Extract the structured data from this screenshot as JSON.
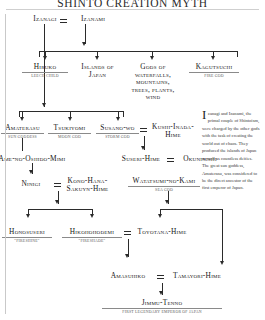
{
  "title": "SHINTO CREATION MYTH",
  "marriage_symbol": "=",
  "nodes": {
    "izanagi": {
      "name": "Izanagi",
      "sub": ""
    },
    "izanami": {
      "name": "Izanami",
      "sub": ""
    },
    "hiruko": {
      "name": "Hiruko",
      "sub": "LEECH CHILD"
    },
    "islands": {
      "name": "Islands of Japan",
      "sub": ""
    },
    "gods_nature": {
      "name": "Gods of waterfalls, mountains, trees, plants, wind",
      "sub": ""
    },
    "kagutsuchi": {
      "name": "Kagutsuchi",
      "sub": "FIRE GOD"
    },
    "amaterasu": {
      "name": "Amaterasu",
      "sub": "SUN GODDESS"
    },
    "tsukiyomi": {
      "name": "Tsukiyomi",
      "sub": "MOON GOD"
    },
    "susanowo": {
      "name": "Susano-wo",
      "sub": "STORM GOD"
    },
    "kushi": {
      "name": "Kushi-Inada-Hime",
      "sub": ""
    },
    "ameno": {
      "name": "Ame-no-Oshido-Mimi",
      "sub": ""
    },
    "suseri": {
      "name": "Suseri-Hime",
      "sub": ""
    },
    "okuninishi": {
      "name": "Okuninishi",
      "sub": ""
    },
    "ninigi": {
      "name": "Ninigi",
      "sub": ""
    },
    "konohana": {
      "name": "Kono-Hana-Sakuyn-Hime",
      "sub": ""
    },
    "watatsumi": {
      "name": "Watatsumi-no-Kami",
      "sub": "SEA GOD"
    },
    "honosuseri": {
      "name": "Honosuseri",
      "sub": "\"FIRESHINE\""
    },
    "hikohohodemi": {
      "name": "Hikohohodemi",
      "sub": "\"FIRESHADE\""
    },
    "toyotana": {
      "name": "Toyotana-Hime",
      "sub": ""
    },
    "amasuhiko": {
      "name": "Amasuhiko",
      "sub": ""
    },
    "tamayori": {
      "name": "Tamayori-Hime",
      "sub": ""
    },
    "jimmu": {
      "name": "Jimmu-Tenno",
      "sub": "FIRST LEGENDARY EMPEROR OF JAPAN"
    }
  },
  "sidebar": {
    "dropcap": "I",
    "body": "zanagi and Izanami, the primal couple of Shintoism, were charged by the other gods with the task of creating the world out of chaos. They produced the islands of Japan as well as countless deities. The great sun goddess, Amaterasu, was considered to be the direct ancestor of the first emperor of Japan."
  },
  "colors": {
    "ink": "#161616",
    "rule": "#8a8a8a",
    "connector": "#2b2b2b",
    "subtitle": "#5d5d5d",
    "background": "#ffffff"
  }
}
